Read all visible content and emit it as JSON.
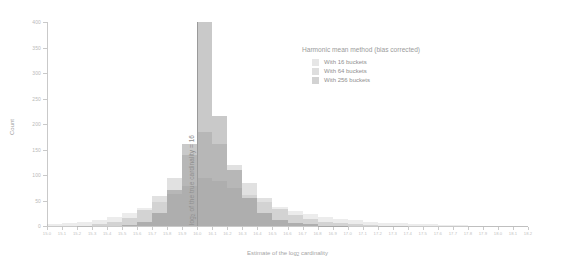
{
  "chart_data": {
    "type": "bar",
    "title": "",
    "subtitle": "",
    "xlabel": "Estimate of the log2 cardinality",
    "xlabel_base": "Estimate of the log",
    "xlabel_sub": "2",
    "xlabel_tail": " cardinality",
    "ylabel": "Count",
    "grid": false,
    "legend_position": "top-right",
    "legend_title": "Harmonic mean method (bias corrected)",
    "xlim": [
      15.0,
      18.2
    ],
    "ylim": [
      0,
      400
    ],
    "y_ticks": [
      0,
      50,
      100,
      150,
      200,
      250,
      300,
      350,
      400
    ],
    "y_tick_labels": [
      "0",
      "50",
      "100",
      "150",
      "200",
      "250",
      "300",
      "350",
      "400"
    ],
    "x_ticks": [
      15.0,
      15.1,
      15.2,
      15.3,
      15.4,
      15.5,
      15.6,
      15.7,
      15.8,
      15.9,
      16.0,
      16.1,
      16.2,
      16.3,
      16.4,
      16.5,
      16.6,
      16.7,
      16.8,
      16.9,
      17.0,
      17.1,
      17.2,
      17.3,
      17.4,
      17.5,
      17.6,
      17.7,
      17.8,
      17.9,
      18.0,
      18.1,
      18.2
    ],
    "x_tick_labels": [
      "15.0",
      "15.1",
      "15.2",
      "15.3",
      "15.4",
      "15.5",
      "15.6",
      "15.7",
      "15.8",
      "15.9",
      "16.0",
      "16.1",
      "16.2",
      "16.3",
      "16.4",
      "16.5",
      "16.6",
      "16.7",
      "16.8",
      "16.9",
      "17.0",
      "17.1",
      "17.2",
      "17.3",
      "17.4",
      "17.5",
      "17.6",
      "17.7",
      "17.8",
      "17.9",
      "18.0",
      "18.1",
      "18.2"
    ],
    "bin_width": 0.1,
    "bin_starts": [
      15.0,
      15.1,
      15.2,
      15.3,
      15.4,
      15.5,
      15.6,
      15.7,
      15.8,
      15.9,
      16.0,
      16.1,
      16.2,
      16.3,
      16.4,
      16.5,
      16.6,
      16.7,
      16.8,
      16.9,
      17.0,
      17.1,
      17.2,
      17.3,
      17.4,
      17.5,
      17.6,
      17.7,
      17.8,
      17.9,
      18.0,
      18.1
    ],
    "series": [
      {
        "name": "With 16 buckets",
        "color": "#8c8c8c",
        "opacity": 0.17,
        "values": [
          3,
          5,
          8,
          12,
          18,
          26,
          36,
          48,
          62,
          78,
          95,
          88,
          74,
          60,
          48,
          38,
          30,
          23,
          18,
          14,
          11,
          8,
          6,
          5,
          4,
          3,
          2,
          2,
          1,
          1,
          1,
          1
        ]
      },
      {
        "name": "With 64 buckets",
        "color": "#8c8c8c",
        "opacity": 0.26,
        "values": [
          0,
          0,
          1,
          3,
          7,
          16,
          32,
          58,
          95,
          140,
          185,
          160,
          120,
          84,
          55,
          34,
          21,
          13,
          8,
          5,
          3,
          2,
          1,
          1,
          0,
          0,
          0,
          0,
          0,
          0,
          0,
          0
        ]
      },
      {
        "name": "With 256 buckets",
        "color": "#787878",
        "opacity": 0.4,
        "values": [
          0,
          0,
          0,
          0,
          0,
          2,
          8,
          25,
          70,
          160,
          400,
          215,
          110,
          55,
          26,
          12,
          6,
          3,
          1,
          1,
          0,
          0,
          0,
          0,
          0,
          0,
          0,
          0,
          0,
          0,
          0,
          0
        ]
      }
    ],
    "annotations": [
      {
        "name": "true-cardinality-line",
        "text": "log2 of the true cardinality = 16",
        "text_base": "log",
        "text_sub": "2",
        "text_tail": " of the true cardinality = 16",
        "x": 16.0,
        "color": "#9a9a9a",
        "orientation": "vertical"
      }
    ]
  },
  "legend": {
    "title": "Harmonic mean method (bias corrected)",
    "items": [
      {
        "label": "With 16 buckets",
        "swatch": "#e6e6e6"
      },
      {
        "label": "With 64 buckets",
        "swatch": "#dedede"
      },
      {
        "label": "With 256 buckets",
        "swatch": "#d2d2d2"
      }
    ]
  },
  "axes": {
    "y_title": "Count",
    "x_title_base": "Estimate of the log",
    "x_title_sub": "2",
    "x_title_tail": " cardinality"
  }
}
